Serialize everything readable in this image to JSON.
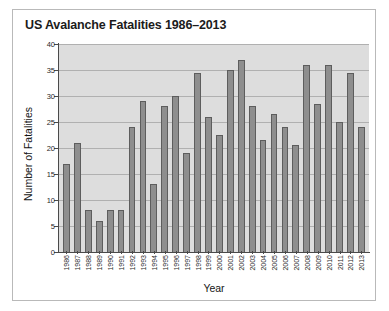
{
  "chart_data": {
    "type": "bar",
    "title": "US Avalanche Fatalities 1986–2013",
    "xlabel": "Year",
    "ylabel": "Number of Fatalities",
    "ylim": [
      0,
      40
    ],
    "ytick_labels": [
      "40",
      "35",
      "30",
      "25",
      "20",
      "15",
      "10",
      "5",
      "0"
    ],
    "ytick_values": [
      40,
      35,
      30,
      25,
      20,
      15,
      10,
      5,
      0
    ],
    "grid": "horizontal",
    "legend": "none",
    "bar_color": "#8e8e8e",
    "bar_edge_color": "#5d5d5d",
    "panel_color": "#dddddd",
    "categories": [
      "1986",
      "1987",
      "1988",
      "1989",
      "1990",
      "1991",
      "1992",
      "1993",
      "1994",
      "1995",
      "1996",
      "1997",
      "1998",
      "1999",
      "2000",
      "2001",
      "2002",
      "2003",
      "2004",
      "2005",
      "2006",
      "2007",
      "2008",
      "2009",
      "2010",
      "2011",
      "2012",
      "2013"
    ],
    "values": [
      17,
      21,
      8,
      6,
      8,
      8,
      24,
      29,
      13,
      28,
      30,
      19,
      34.5,
      26,
      22.5,
      35,
      37,
      28,
      21.5,
      26.5,
      24,
      20.5,
      36,
      28.5,
      36,
      25,
      34.5,
      24
    ]
  }
}
